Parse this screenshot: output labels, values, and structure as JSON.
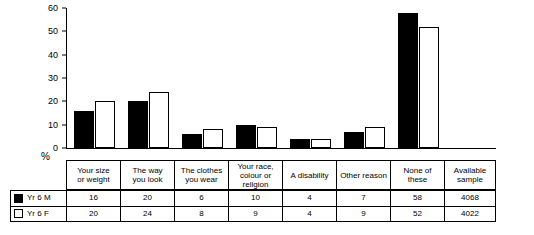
{
  "chart_data": {
    "type": "bar",
    "title": "",
    "xlabel": "",
    "ylabel": "%",
    "ylim": [
      0,
      60
    ],
    "yticks": [
      0,
      10,
      20,
      30,
      40,
      50,
      60
    ],
    "grid": false,
    "legend_position": "bottom-left-table",
    "categories": [
      "Your size\nor weight",
      "The way\nyou look",
      "The clothes\nyou wear",
      "Your race,\ncolour or\nreligion",
      "A disability",
      "Other reason",
      "None of these"
    ],
    "series": [
      {
        "name": "Yr 6 M",
        "values": [
          16,
          20,
          6,
          10,
          4,
          7,
          58
        ],
        "style": "solid"
      },
      {
        "name": "Yr 6 F",
        "values": [
          20,
          24,
          8,
          9,
          4,
          9,
          52
        ],
        "style": "hollow"
      }
    ],
    "extra_column": {
      "header": "Available\nsample",
      "values": [
        "4068",
        "4022"
      ]
    }
  },
  "axis": {
    "y_label": "%",
    "y_ticks": [
      "0",
      "10",
      "20",
      "30",
      "40",
      "50",
      "60"
    ]
  },
  "categories": [
    {
      "line1": "Your size",
      "line2": "or weight",
      "line3": ""
    },
    {
      "line1": "The way",
      "line2": "you look",
      "line3": ""
    },
    {
      "line1": "The clothes",
      "line2": "you wear",
      "line3": ""
    },
    {
      "line1": "Your race,",
      "line2": "colour or",
      "line3": "religion"
    },
    {
      "line1": "A disability",
      "line2": "",
      "line3": ""
    },
    {
      "line1": "Other reason",
      "line2": "",
      "line3": ""
    },
    {
      "line1": "None of these",
      "line2": "",
      "line3": ""
    },
    {
      "line1": "Available",
      "line2": "sample",
      "line3": ""
    }
  ],
  "table": {
    "rows": [
      {
        "label": "Yr 6 M",
        "swatch": "solid",
        "values": [
          "16",
          "20",
          "6",
          "10",
          "4",
          "7",
          "58",
          "4068"
        ]
      },
      {
        "label": "Yr 6 F",
        "swatch": "hollow",
        "values": [
          "20",
          "24",
          "8",
          "9",
          "4",
          "9",
          "52",
          "4022"
        ]
      }
    ]
  }
}
